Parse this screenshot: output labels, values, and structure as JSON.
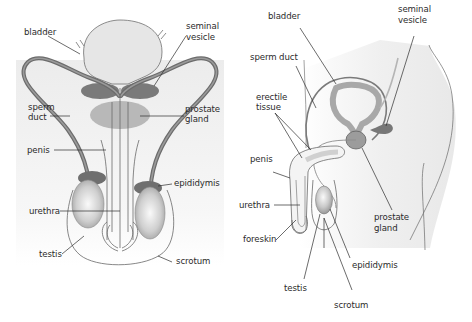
{
  "figure": {
    "colors": {
      "organ_light": "#e4e4e4",
      "organ_mid": "#bdbdbd",
      "organ_dark": "#7c7c7c",
      "duct": "#6f6f6f",
      "outline": "#5a5a5a",
      "leader_line": "#333333",
      "background_fade": "#f0f0f0"
    },
    "front_view": {
      "labels": {
        "bladder": "bladder",
        "seminal_vesicle_line1": "seminal",
        "seminal_vesicle_line2": "vesicle",
        "sperm_duct_line1": "sperm",
        "sperm_duct_line2": "duct",
        "prostate_gland_line1": "prostate",
        "prostate_gland_line2": "gland",
        "penis": "penis",
        "epididymis": "epididymis",
        "urethra": "urethra",
        "testis": "testis",
        "scrotum": "scrotum"
      }
    },
    "side_view": {
      "labels": {
        "bladder": "bladder",
        "seminal_vesicle_line1": "seminal",
        "seminal_vesicle_line2": "vesicle",
        "sperm_duct": "sperm duct",
        "erectile_tissue_line1": "erectile",
        "erectile_tissue_line2": "tissue",
        "penis": "penis",
        "urethra": "urethra",
        "foreskin": "foreskin",
        "prostate_gland_line1": "prostate",
        "prostate_gland_line2": "gland",
        "epididymis": "epididymis",
        "testis": "testis",
        "scrotum": "scrotum"
      }
    }
  }
}
